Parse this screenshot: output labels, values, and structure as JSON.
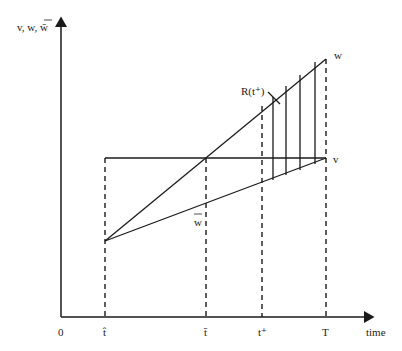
{
  "diagram": {
    "type": "economic-wage-path-diagram",
    "y_axis_label": "v, w, w̄",
    "x_axis_label": "time",
    "x_ticks": [
      {
        "id": "origin",
        "label": "0"
      },
      {
        "id": "t_hat",
        "label": "t̂"
      },
      {
        "id": "t_bar",
        "label": "t̄"
      },
      {
        "id": "t_plus",
        "label": "t⁺"
      },
      {
        "id": "T",
        "label": "T"
      }
    ],
    "curve_labels": {
      "w": "w",
      "v": "v",
      "w_bar": "w",
      "region": "R(t⁺)"
    },
    "colors": {
      "line": "#1a1a1a",
      "background": "#ffffff"
    }
  }
}
